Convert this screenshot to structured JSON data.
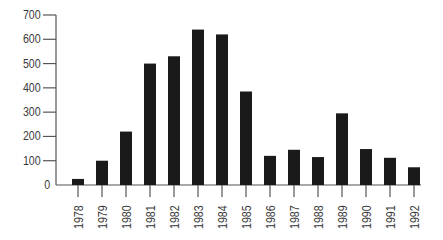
{
  "chart_data": {
    "type": "bar",
    "title": "",
    "xlabel": "",
    "ylabel": "",
    "categories": [
      "1978",
      "1979",
      "1980",
      "1981",
      "1982",
      "1983",
      "1984",
      "1985",
      "1986",
      "1987",
      "1988",
      "1989",
      "1990",
      "1991",
      "1992"
    ],
    "values": [
      25,
      100,
      220,
      500,
      530,
      640,
      620,
      385,
      120,
      145,
      115,
      295,
      148,
      112,
      73
    ],
    "ylim": [
      0,
      700
    ],
    "yticks": [
      0,
      100,
      200,
      300,
      400,
      500,
      600,
      700
    ],
    "grid": false,
    "legend": null,
    "bar_color": "#1a1a1a",
    "axis_color": "#555555"
  }
}
